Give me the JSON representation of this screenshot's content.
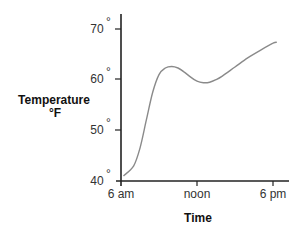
{
  "chart_data": {
    "type": "line",
    "title": "",
    "xlabel": "Time",
    "ylabel": "Temperature",
    "ylabel_unit": "°F",
    "x_ticks": [
      "6 am",
      "noon",
      "6 pm"
    ],
    "x_tick_hours": [
      6,
      12,
      18
    ],
    "y_ticks": [
      "40°",
      "50°",
      "60°",
      "70°"
    ],
    "y_tick_values": [
      40,
      50,
      60,
      70
    ],
    "xlim": [
      6,
      19.3
    ],
    "ylim": [
      40,
      73
    ],
    "grid": false,
    "legend": null,
    "series": [
      {
        "name": "Temperature",
        "color": "#8a8a8a",
        "x": [
          6.2,
          7.0,
          7.5,
          8.0,
          8.5,
          9.0,
          9.5,
          10.0,
          10.5,
          11.0,
          11.5,
          12.0,
          12.5,
          13.0,
          13.5,
          14.0,
          15.0,
          16.0,
          17.0,
          18.0,
          18.3
        ],
        "y": [
          41.0,
          43.0,
          46.5,
          52.0,
          57.5,
          61.0,
          62.3,
          62.6,
          62.3,
          61.5,
          60.5,
          59.7,
          59.4,
          59.5,
          60.0,
          60.7,
          62.5,
          64.3,
          65.8,
          67.2,
          67.4
        ]
      }
    ]
  },
  "labels": {
    "y_axis_title": "Temperature",
    "y_axis_unit": "°F",
    "x_axis_title": "Time",
    "y_tick_70": "70",
    "y_tick_60": "60",
    "y_tick_50": "50",
    "y_tick_40": "40",
    "degree": "°",
    "x_tick_6am": "6 am",
    "x_tick_noon": "noon",
    "x_tick_6pm": "6 pm"
  }
}
